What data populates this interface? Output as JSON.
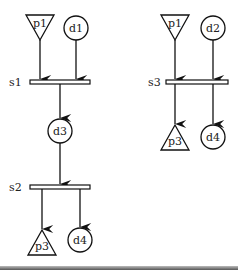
{
  "diagram": {
    "left": {
      "nodes": {
        "p1": {
          "label": "p1",
          "shape": "inverted-triangle"
        },
        "d1": {
          "label": "d1",
          "shape": "circle"
        },
        "d3": {
          "label": "d3",
          "shape": "circle"
        },
        "p3": {
          "label": "p3",
          "shape": "triangle"
        },
        "d4": {
          "label": "d4",
          "shape": "circle"
        }
      },
      "transitions": {
        "s1": {
          "label": "s1"
        },
        "s2": {
          "label": "s2"
        }
      },
      "edges": [
        {
          "from": "p1",
          "to": "s1"
        },
        {
          "from": "d1",
          "to": "s1"
        },
        {
          "from": "s1",
          "to": "d3"
        },
        {
          "from": "d3",
          "to": "s2"
        },
        {
          "from": "s2",
          "to": "p3"
        },
        {
          "from": "s2",
          "to": "d4"
        }
      ]
    },
    "right": {
      "nodes": {
        "p1": {
          "label": "p1",
          "shape": "inverted-triangle"
        },
        "d2": {
          "label": "d2",
          "shape": "circle"
        },
        "p3": {
          "label": "p3",
          "shape": "triangle"
        },
        "d4": {
          "label": "d4",
          "shape": "circle"
        }
      },
      "transitions": {
        "s3": {
          "label": "s3"
        }
      },
      "edges": [
        {
          "from": "p1",
          "to": "s3"
        },
        {
          "from": "d2",
          "to": "s3"
        },
        {
          "from": "s3",
          "to": "p3"
        },
        {
          "from": "s3",
          "to": "d4"
        }
      ]
    }
  }
}
